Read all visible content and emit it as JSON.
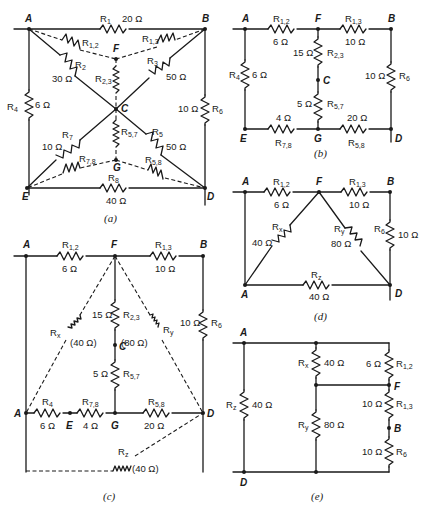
{
  "figure": {
    "panels": [
      {
        "id": "a",
        "caption": "(a)",
        "nodes": [
          "A",
          "B",
          "C",
          "D",
          "E",
          "F",
          "G"
        ],
        "resistors": [
          {
            "name": "R1",
            "label": "R",
            "sub": "1",
            "value": "20 Ω"
          },
          {
            "name": "R2",
            "label": "R",
            "sub": "2",
            "value": "30 Ω"
          },
          {
            "name": "R3",
            "label": "R",
            "sub": "3",
            "value": "50 Ω"
          },
          {
            "name": "R4",
            "label": "R",
            "sub": "4",
            "value": "6 Ω"
          },
          {
            "name": "R5",
            "label": "R",
            "sub": "5",
            "value": "50 Ω"
          },
          {
            "name": "R6",
            "label": "R",
            "sub": "6",
            "value": "10 Ω"
          },
          {
            "name": "R7",
            "label": "R",
            "sub": "7",
            "value": "10 Ω"
          },
          {
            "name": "R8",
            "label": "R",
            "sub": "8",
            "value": "40 Ω"
          },
          {
            "name": "R1,2",
            "label": "R",
            "sub": "1,2",
            "value": ""
          },
          {
            "name": "R1,3",
            "label": "R",
            "sub": "1,3",
            "value": ""
          },
          {
            "name": "R2,3",
            "label": "R",
            "sub": "2,3",
            "value": ""
          },
          {
            "name": "R5,7",
            "label": "R",
            "sub": "5,7",
            "value": ""
          },
          {
            "name": "R7,8",
            "label": "R",
            "sub": "7,8",
            "value": ""
          },
          {
            "name": "R5,8",
            "label": "R",
            "sub": "5,8",
            "value": ""
          }
        ]
      },
      {
        "id": "b",
        "caption": "(b)",
        "nodes": [
          "A",
          "B",
          "C",
          "D",
          "E",
          "F",
          "G"
        ],
        "resistors": [
          {
            "name": "R1,2",
            "label": "R",
            "sub": "1,2",
            "value": "6 Ω"
          },
          {
            "name": "R1,3",
            "label": "R",
            "sub": "1,3",
            "value": "10 Ω"
          },
          {
            "name": "R2,3",
            "label": "R",
            "sub": "2,3",
            "value": "15 Ω"
          },
          {
            "name": "R4",
            "label": "R",
            "sub": "4",
            "value": "6 Ω"
          },
          {
            "name": "R5,7",
            "label": "R",
            "sub": "5,7",
            "value": "5 Ω"
          },
          {
            "name": "R6",
            "label": "R",
            "sub": "6",
            "value": "10 Ω"
          },
          {
            "name": "R7,8",
            "label": "R",
            "sub": "7,8",
            "value": "4 Ω"
          },
          {
            "name": "R5,8",
            "label": "R",
            "sub": "5,8",
            "value": "20 Ω"
          }
        ]
      },
      {
        "id": "c",
        "caption": "(c)",
        "nodes": [
          "A",
          "B",
          "C",
          "D",
          "E",
          "F",
          "G"
        ],
        "resistors": [
          {
            "name": "R1,2",
            "label": "R",
            "sub": "1,2",
            "value": "6 Ω"
          },
          {
            "name": "R1,3",
            "label": "R",
            "sub": "1,3",
            "value": "10 Ω"
          },
          {
            "name": "R2,3",
            "label": "R",
            "sub": "2,3",
            "value": "15 Ω"
          },
          {
            "name": "R5,7",
            "label": "R",
            "sub": "5,7",
            "value": "5 Ω"
          },
          {
            "name": "R6",
            "label": "R",
            "sub": "6",
            "value": "10 Ω"
          },
          {
            "name": "R4",
            "label": "R",
            "sub": "4",
            "value": "6 Ω"
          },
          {
            "name": "R7,8",
            "label": "R",
            "sub": "7,8",
            "value": "4 Ω"
          },
          {
            "name": "R5,8",
            "label": "R",
            "sub": "5,8",
            "value": "20 Ω"
          },
          {
            "name": "Rx",
            "label": "R",
            "sub": "x",
            "value": "(40 Ω)"
          },
          {
            "name": "Ry",
            "label": "R",
            "sub": "y",
            "value": "(80 Ω)"
          },
          {
            "name": "Rz",
            "label": "R",
            "sub": "z",
            "value": "(40 Ω)"
          }
        ]
      },
      {
        "id": "d",
        "caption": "(d)",
        "nodes": [
          "A",
          "B",
          "D",
          "F",
          "A"
        ],
        "resistors": [
          {
            "name": "R1,2",
            "label": "R",
            "sub": "1,2",
            "value": "6 Ω"
          },
          {
            "name": "R1,3",
            "label": "R",
            "sub": "1,3",
            "value": "10 Ω"
          },
          {
            "name": "Rx",
            "label": "R",
            "sub": "x",
            "value": "40 Ω"
          },
          {
            "name": "Ry",
            "label": "R",
            "sub": "y",
            "value": "80 Ω"
          },
          {
            "name": "R6",
            "label": "R",
            "sub": "6",
            "value": "10 Ω"
          },
          {
            "name": "Rz",
            "label": "R",
            "sub": "z",
            "value": "40 Ω"
          }
        ]
      },
      {
        "id": "e",
        "caption": "(e)",
        "nodes": [
          "A",
          "B",
          "D",
          "F"
        ],
        "resistors": [
          {
            "name": "Rz",
            "label": "R",
            "sub": "z",
            "value": "40 Ω"
          },
          {
            "name": "Rx",
            "label": "R",
            "sub": "x",
            "value": "40 Ω"
          },
          {
            "name": "Ry",
            "label": "R",
            "sub": "y",
            "value": "80 Ω"
          },
          {
            "name": "R1,2",
            "label": "R",
            "sub": "1,2",
            "value": "6 Ω"
          },
          {
            "name": "R1,3",
            "label": "R",
            "sub": "1,3",
            "value": "10 Ω"
          },
          {
            "name": "R6",
            "label": "R",
            "sub": "6",
            "value": "10 Ω"
          }
        ]
      }
    ]
  }
}
